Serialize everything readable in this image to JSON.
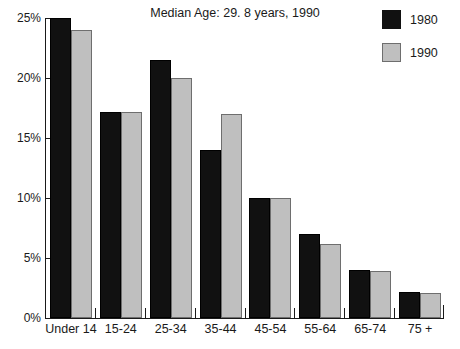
{
  "chart_data": {
    "type": "bar",
    "title": "Median Age: 29. 8 years, 1990",
    "xlabel": "",
    "ylabel": "",
    "categories": [
      "Under 14",
      "15-24",
      "25-34",
      "35-44",
      "45-54",
      "55-64",
      "65-74",
      "75 +"
    ],
    "series": [
      {
        "name": "1980",
        "color": "#111111",
        "values": [
          25.0,
          17.2,
          21.5,
          14.0,
          10.0,
          7.0,
          4.0,
          2.2
        ]
      },
      {
        "name": "1990",
        "color": "#bfbfbf",
        "values": [
          24.0,
          17.2,
          20.0,
          17.0,
          10.0,
          6.2,
          3.9,
          2.1
        ]
      }
    ],
    "ylim": [
      0,
      25
    ],
    "yticks": [
      0,
      5,
      10,
      15,
      20,
      25
    ],
    "ytick_labels": [
      "0%",
      "5%",
      "10%",
      "15%",
      "20%",
      "25%"
    ],
    "grid": false,
    "legend_position": "top-right"
  },
  "legend": {
    "entries": [
      {
        "label": "1980",
        "swatch": "dark-swatch"
      },
      {
        "label": "1990",
        "swatch": "light-swatch"
      }
    ]
  }
}
